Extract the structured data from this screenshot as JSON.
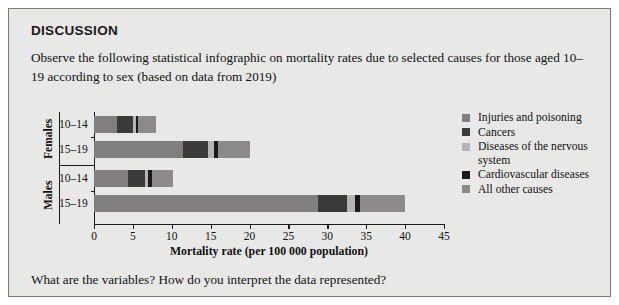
{
  "panel": {
    "title": "DISCUSSION",
    "intro": "Observe the following statistical infographic on mortality rates due to selected causes for those aged 10–19 according to sex (based on data from 2019)",
    "question": "What are the variables? How do you interpret the data represented?"
  },
  "chart_data": {
    "type": "bar",
    "orientation": "horizontal",
    "stacked": true,
    "title": "",
    "xlabel": "Mortality rate (per 100 000 population)",
    "ylabel": "",
    "xlim": [
      0,
      45
    ],
    "xticks": [
      0,
      5,
      10,
      15,
      20,
      25,
      30,
      35,
      40,
      45
    ],
    "xticklabels": [
      "0",
      "5",
      "10",
      "15",
      "20",
      "25",
      "30",
      "35",
      "40",
      "45"
    ],
    "grid": false,
    "legend_position": "right",
    "groups": [
      {
        "name": "Females",
        "categories": [
          "10–14",
          "15–19"
        ]
      },
      {
        "name": "Males",
        "categories": [
          "10–14",
          "15–19"
        ]
      }
    ],
    "categories": [
      "Females 10–14",
      "Females 15–19",
      "Males 10–14",
      "Males 15–19"
    ],
    "series": [
      {
        "name": "Injuries and poisoning",
        "color": "#807f7d",
        "values": [
          3.0,
          11.5,
          4.4,
          28.8
        ]
      },
      {
        "name": "Cancers",
        "color": "#3a3a3a",
        "values": [
          2.0,
          3.1,
          2.1,
          3.7
        ]
      },
      {
        "name": "Diseases of the nervous system",
        "color": "#b5b5b3",
        "values": [
          0.4,
          0.8,
          0.5,
          1.1
        ]
      },
      {
        "name": "Cardiovascular diseases",
        "color": "#1a1a1a",
        "values": [
          0.3,
          0.6,
          0.4,
          0.6
        ]
      },
      {
        "name": "All other causes",
        "color": "#8c8b89",
        "values": [
          2.3,
          4.0,
          2.8,
          5.8
        ]
      }
    ],
    "totals": [
      8.0,
      20.0,
      10.2,
      40.0
    ],
    "legend": [
      "Injuries and poisoning",
      "Cancers",
      "Diseases of the nervous system",
      "Cardiovascular diseases",
      "All other causes"
    ]
  }
}
